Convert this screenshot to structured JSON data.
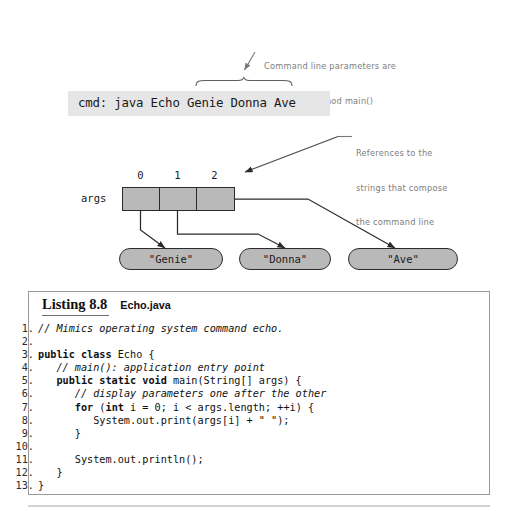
{
  "annotations": {
    "top": {
      "line1": "Command line parameters are",
      "line2": "passed to method main()"
    },
    "right": {
      "line1": "References to the",
      "line2": "strings that compose",
      "line3": "the command line"
    }
  },
  "command_line": {
    "text": "cmd: java Echo Genie Donna Ave",
    "background": "#e6e6e6"
  },
  "array": {
    "label": "args",
    "indices": [
      "0",
      "1",
      "2"
    ],
    "cell_fill": "#b9b9b9",
    "border_color": "#2b2b2b"
  },
  "values": [
    {
      "label": "\"Genie\""
    },
    {
      "label": "\"Donna\""
    },
    {
      "label": "\"Ave\""
    }
  ],
  "listing": {
    "title": "Listing 8.8",
    "filename": "Echo.java",
    "lines": [
      {
        "no": "1.",
        "parts": [
          {
            "t": "// Mimics operating system command echo.",
            "s": "cm"
          }
        ]
      },
      {
        "no": "2.",
        "parts": [
          {
            "t": "",
            "s": ""
          }
        ]
      },
      {
        "no": "3.",
        "parts": [
          {
            "t": "public class ",
            "s": "kw"
          },
          {
            "t": "Echo {",
            "s": ""
          }
        ]
      },
      {
        "no": "4.",
        "parts": [
          {
            "t": "   ",
            "s": ""
          },
          {
            "t": "// main(): application entry point",
            "s": "cm"
          }
        ]
      },
      {
        "no": "5.",
        "parts": [
          {
            "t": "   ",
            "s": ""
          },
          {
            "t": "public static void ",
            "s": "kw"
          },
          {
            "t": "main(String[] args) {",
            "s": ""
          }
        ]
      },
      {
        "no": "6.",
        "parts": [
          {
            "t": "      ",
            "s": ""
          },
          {
            "t": "// display parameters one after the other",
            "s": "cm"
          }
        ]
      },
      {
        "no": "7.",
        "parts": [
          {
            "t": "      ",
            "s": ""
          },
          {
            "t": "for ",
            "s": "kw"
          },
          {
            "t": "(",
            "s": ""
          },
          {
            "t": "int ",
            "s": "kw"
          },
          {
            "t": "i = 0; i < args.length; ++i) {",
            "s": ""
          }
        ]
      },
      {
        "no": "8.",
        "parts": [
          {
            "t": "         System.out.print(args[i] + \" \");",
            "s": ""
          }
        ]
      },
      {
        "no": "9.",
        "parts": [
          {
            "t": "      }",
            "s": ""
          }
        ]
      },
      {
        "no": "10.",
        "parts": [
          {
            "t": "",
            "s": ""
          }
        ]
      },
      {
        "no": "11.",
        "parts": [
          {
            "t": "      System.out.println();",
            "s": ""
          }
        ]
      },
      {
        "no": "12.",
        "parts": [
          {
            "t": "   }",
            "s": ""
          }
        ]
      },
      {
        "no": "13.",
        "parts": [
          {
            "t": "}",
            "s": ""
          }
        ]
      }
    ]
  }
}
